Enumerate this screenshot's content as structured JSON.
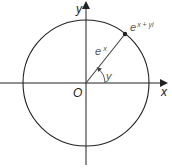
{
  "diagram": {
    "title": "",
    "type": "complex-plane-unit-circle",
    "colors": {
      "stroke": "#222222",
      "label": "#222222",
      "label_muted": "#555555",
      "background": "#ffffff"
    },
    "axes": {
      "x_label": "x",
      "y_label": "y",
      "origin_label": "O"
    },
    "circle": {
      "center": [
        86,
        83
      ],
      "radius": 63
    },
    "point": {
      "position": [
        125,
        34
      ],
      "label_base": "e",
      "label_exponent": "x + yi"
    },
    "radius_line": {
      "label_base": "e",
      "label_exponent": "x"
    },
    "angle": {
      "label": "y"
    }
  }
}
